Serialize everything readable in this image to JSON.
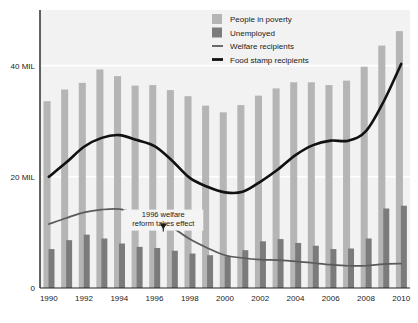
{
  "chart_data": {
    "type": "bar",
    "title": "",
    "subtitle": "",
    "xlabel": "",
    "ylabel": "",
    "xlim": [
      1989.4,
      2010.6
    ],
    "ylim": [
      0,
      50
    ],
    "grid": true,
    "gridlines": [
      20,
      40
    ],
    "legend_position": "top-right",
    "x": [
      1990,
      1991,
      1992,
      1993,
      1994,
      1995,
      1996,
      1997,
      1998,
      1999,
      2000,
      2001,
      2002,
      2003,
      2004,
      2005,
      2006,
      2007,
      2008,
      2009,
      2010
    ],
    "categories": [
      "1990",
      "1991",
      "1992",
      "1993",
      "1994",
      "1995",
      "1996",
      "1997",
      "1998",
      "1999",
      "2000",
      "2001",
      "2002",
      "2003",
      "2004",
      "2005",
      "2006",
      "2007",
      "2008",
      "2009",
      "2010"
    ],
    "tick_labels_x": [
      "1990",
      "1992",
      "1994",
      "1996",
      "1998",
      "2000",
      "2002",
      "2004",
      "2006",
      "2008",
      "2010"
    ],
    "tick_labels_y": [
      "0",
      "20 MIL",
      "40 MIL"
    ],
    "tick_values_y": [
      0,
      20,
      40
    ],
    "series": [
      {
        "name": "People in poverty",
        "type": "bar",
        "color": "#b5b5b5",
        "values": [
          33.6,
          35.7,
          36.9,
          39.3,
          38.1,
          36.4,
          36.5,
          35.6,
          34.5,
          32.8,
          31.6,
          32.9,
          34.6,
          35.9,
          37.0,
          37.0,
          36.5,
          37.3,
          39.8,
          43.6,
          46.2
        ]
      },
      {
        "name": "Unemployed",
        "type": "bar",
        "color": "#7b7b7b",
        "values": [
          7.0,
          8.6,
          9.6,
          8.9,
          8.0,
          7.4,
          7.2,
          6.7,
          6.2,
          5.9,
          5.7,
          6.8,
          8.4,
          8.8,
          8.1,
          7.6,
          7.0,
          7.1,
          8.9,
          14.3,
          14.8
        ]
      },
      {
        "name": "Welfare recipients",
        "type": "line",
        "color": "#5a5a5a",
        "values": [
          11.5,
          12.6,
          13.6,
          14.1,
          14.2,
          13.4,
          12.6,
          10.9,
          8.8,
          7.2,
          5.9,
          5.4,
          5.1,
          5.0,
          4.8,
          4.5,
          4.2,
          4.0,
          4.0,
          4.3,
          4.4
        ]
      },
      {
        "name": "Food stamp recipients",
        "type": "line",
        "color": "#111111",
        "values": [
          20.0,
          22.6,
          25.4,
          27.0,
          27.5,
          26.6,
          25.5,
          22.9,
          19.8,
          18.2,
          17.2,
          17.3,
          19.1,
          21.3,
          23.9,
          25.7,
          26.5,
          26.5,
          28.2,
          33.5,
          40.3
        ]
      }
    ],
    "annotations": [
      {
        "text_line1": "1996 welfare",
        "text_line2": "reform takes effect",
        "x": 1996.5,
        "y": 13.2,
        "arrow": "down",
        "target_x": 1996.5,
        "target_y": 10.5
      }
    ]
  },
  "legend": {
    "items": [
      {
        "label": "People in poverty",
        "marker": "swatch",
        "color": "#b5b5b5"
      },
      {
        "label": "Unemployed",
        "marker": "swatch",
        "color": "#7b7b7b"
      },
      {
        "label": "Welfare recipients",
        "marker": "line-thin",
        "color": "#5a5a5a"
      },
      {
        "label": "Food stamp recipients",
        "marker": "line-thick",
        "color": "#111111"
      }
    ]
  },
  "axes": {
    "y_labels": [
      "40 MIL",
      "20 MIL",
      "0"
    ],
    "x_labels": [
      "1990",
      "1992",
      "1994",
      "1996",
      "1998",
      "2000",
      "2002",
      "2004",
      "2006",
      "2008",
      "2010"
    ]
  },
  "annotation": {
    "line1": "1996 welfare",
    "line2": "reform takes effect"
  }
}
